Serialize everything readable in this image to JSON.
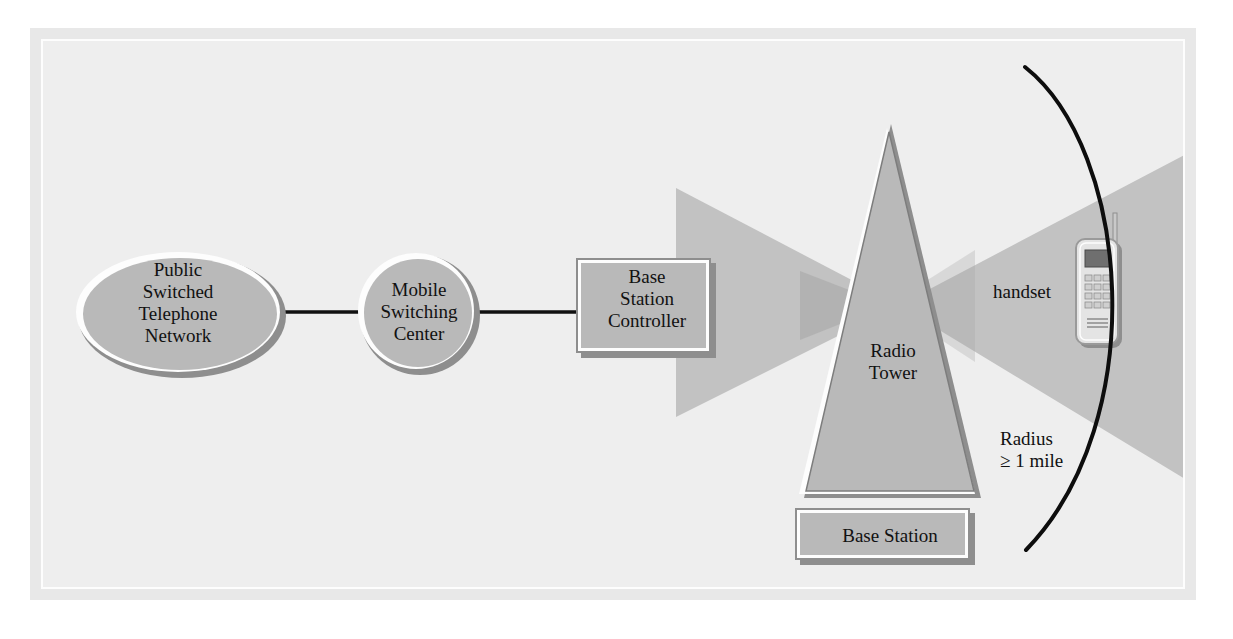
{
  "figure": {
    "background_color": "#ffffff",
    "plate_color": "#e8e8e8",
    "canvas_color": "#eeeeee",
    "shape_fill": "#b9b9b9",
    "shape_shadow": "#8e8e8e",
    "shape_highlight": "#ffffff",
    "beam_color": "#c2c2c2",
    "line_color": "#111111"
  },
  "nodes": {
    "pstn": {
      "label": "Public\nSwitched\nTelephone\nNetwork",
      "shape": "ellipse"
    },
    "msc": {
      "label": "Mobile\nSwitching\nCenter",
      "shape": "circle"
    },
    "bsc": {
      "label": "Base\nStation\nController",
      "shape": "rectangle"
    },
    "radio_tower": {
      "label": "Radio\nTower",
      "shape": "triangle"
    },
    "base_station": {
      "label": "Base Station",
      "shape": "rectangle"
    },
    "handset": {
      "label": "handset",
      "shape": "mobile-phone"
    },
    "coverage": {
      "label": "Radius\n≥ 1 mile",
      "shape": "arc"
    }
  },
  "connections": [
    {
      "from": "pstn",
      "to": "msc"
    },
    {
      "from": "msc",
      "to": "bsc"
    }
  ]
}
